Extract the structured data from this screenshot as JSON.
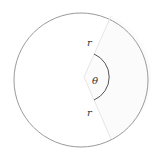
{
  "diagram": {
    "labels": {
      "radius_top": "r",
      "radius_bottom": "r",
      "angle": "θ"
    },
    "colors": {
      "circle_stroke": "#9a9a9a",
      "radius_stroke": "#e6e6e6",
      "arc_stroke": "#555555",
      "sector_fill": "#fbfbfb",
      "background": "#ffffff"
    }
  }
}
